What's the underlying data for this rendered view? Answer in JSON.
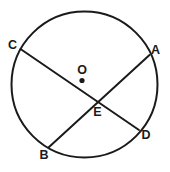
{
  "figure": {
    "background_color": "#ffffff",
    "stroke_color": "#1a1a1a",
    "label_color": "#1a1a1a"
  },
  "circle": {
    "name": "circle-outline",
    "center_x": 84.5,
    "center_y": 84.5,
    "radius": 73,
    "stroke_width": 2.0
  },
  "center_point": {
    "label": "O",
    "dot_x": 82,
    "dot_y": 80.5,
    "dot_radius": 2.6,
    "label_x": 82,
    "label_y": 71
  },
  "intersection_point": {
    "label": "E",
    "x": 96,
    "y": 99,
    "label_x": 97.5,
    "label_y": 113
  },
  "chords": [
    {
      "name": "chord-cd",
      "from": "C",
      "to": "D",
      "x1": 20.5,
      "y1": 49.0,
      "x2": 139.0,
      "y2": 130.0,
      "stroke_width": 2.0
    },
    {
      "name": "chord-ab",
      "from": "A",
      "to": "B",
      "x1": 149.5,
      "y1": 55.0,
      "x2": 48.5,
      "y2": 147.5,
      "stroke_width": 2.0
    }
  ],
  "labels": [
    {
      "id": "label-c",
      "text": "C",
      "x": 12.5,
      "y": 45.5
    },
    {
      "id": "label-a",
      "text": "A",
      "x": 155.5,
      "y": 50.5
    },
    {
      "id": "label-o",
      "text": "O",
      "x": 82.0,
      "y": 71.0
    },
    {
      "id": "label-e",
      "text": "E",
      "x": 97.5,
      "y": 113.0
    },
    {
      "id": "label-d",
      "text": "D",
      "x": 146.0,
      "y": 135.5
    },
    {
      "id": "label-b",
      "text": "B",
      "x": 44.0,
      "y": 156.0
    }
  ]
}
